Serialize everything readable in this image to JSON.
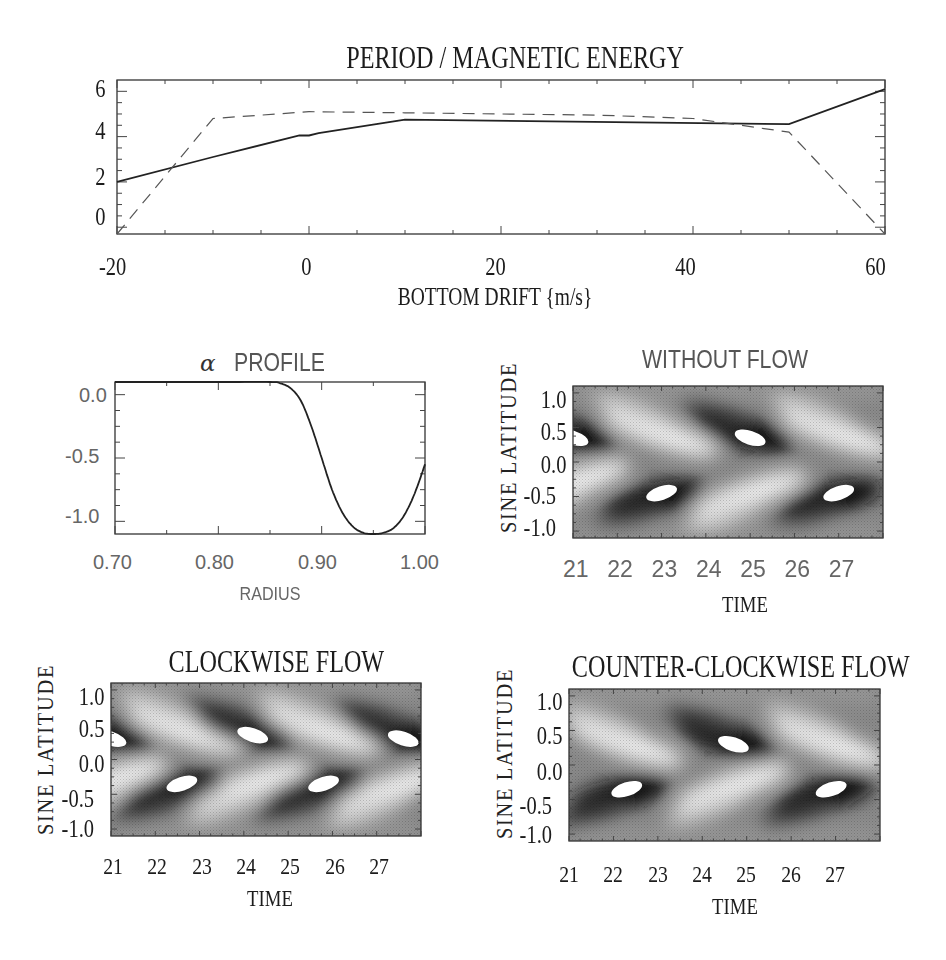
{
  "figure": {
    "top_plot": {
      "title": "PERIOD / MAGNETIC ENERGY",
      "xlabel": "BOTTOM DRIFT {m/s}",
      "xticks": [
        "-20",
        "0",
        "20",
        "40",
        "60"
      ],
      "yticks": [
        "6",
        "4",
        "2",
        "0"
      ]
    },
    "alpha_plot": {
      "title_symbol": "α",
      "title": "PROFILE",
      "xlabel": "RADIUS",
      "xticks": [
        "0.70",
        "0.80",
        "0.90",
        "1.00"
      ],
      "yticks": [
        "0.0",
        "-0.5",
        "-1.0"
      ]
    },
    "without_flow": {
      "title": "WITHOUT FLOW",
      "xlabel": "TIME",
      "ylabel": "SINE LATITUDE",
      "xticks": [
        "21",
        "22",
        "23",
        "24",
        "25",
        "26",
        "27"
      ],
      "yticks": [
        "1.0",
        "0.5",
        "0.0",
        "-0.5",
        "-1.0"
      ]
    },
    "clockwise": {
      "title": "CLOCKWISE FLOW",
      "xlabel": "TIME",
      "ylabel": "SINE LATITUDE",
      "xticks": [
        "21",
        "22",
        "23",
        "24",
        "25",
        "26",
        "27"
      ],
      "yticks": [
        "1.0",
        "0.5",
        "0.0",
        "-0.5",
        "-1.0"
      ]
    },
    "counter_clockwise": {
      "title": "COUNTER-CLOCKWISE FLOW",
      "xlabel": "TIME",
      "ylabel": "SINE LATITUDE",
      "xticks": [
        "21",
        "22",
        "23",
        "24",
        "25",
        "26",
        "27"
      ],
      "yticks": [
        "1.0",
        "0.5",
        "0.0",
        "-0.5",
        "-1.0"
      ]
    }
  },
  "chart_data": [
    {
      "type": "line",
      "title": "PERIOD / MAGNETIC ENERGY",
      "xlabel": "BOTTOM DRIFT {m/s}",
      "ylabel": "",
      "xlim": [
        -20,
        60
      ],
      "ylim": [
        -0.3,
        6.5
      ],
      "grid": false,
      "series": [
        {
          "name": "period (solid)",
          "style": "solid",
          "x": [
            -20,
            -10,
            -1,
            0,
            1,
            10,
            50,
            60
          ],
          "y": [
            2.0,
            3.1,
            4.05,
            4.05,
            4.15,
            4.75,
            4.55,
            6.1
          ]
        },
        {
          "name": "magnetic energy (dashed)",
          "style": "dashed",
          "x": [
            -20,
            -10,
            0,
            10,
            20,
            30,
            40,
            50,
            60
          ],
          "y": [
            -0.3,
            4.8,
            5.1,
            5.05,
            5.0,
            4.95,
            4.8,
            4.2,
            -0.3
          ]
        }
      ]
    },
    {
      "type": "line",
      "title": "α PROFILE",
      "xlabel": "RADIUS",
      "ylabel": "",
      "xlim": [
        0.7,
        1.0
      ],
      "ylim": [
        -1.1,
        0.1
      ],
      "grid": false,
      "series": [
        {
          "name": "alpha",
          "x": [
            0.7,
            0.8,
            0.85,
            0.86,
            0.87,
            0.88,
            0.89,
            0.9,
            0.91,
            0.92,
            0.93,
            0.94,
            0.95,
            0.96,
            0.97,
            0.98,
            0.99,
            1.0
          ],
          "y": [
            0.1,
            0.1,
            0.1,
            0.09,
            0.05,
            -0.05,
            -0.25,
            -0.5,
            -0.75,
            -0.93,
            -1.04,
            -1.09,
            -1.1,
            -1.09,
            -1.05,
            -0.95,
            -0.78,
            -0.55
          ]
        }
      ]
    },
    {
      "type": "heatmap",
      "title": "WITHOUT FLOW",
      "xlabel": "TIME",
      "ylabel": "SINE LATITUDE",
      "xlim": [
        21,
        28
      ],
      "ylim": [
        -1.1,
        1.1
      ],
      "features": {
        "north_dark_cores": [
          {
            "x": 21.0,
            "y": 0.35
          },
          {
            "x": 25.0,
            "y": 0.35
          }
        ],
        "south_dark_cores": [
          {
            "x": 23.0,
            "y": -0.45
          },
          {
            "x": 27.0,
            "y": -0.45
          }
        ],
        "north_bright_bands": [
          {
            "x": 23.0,
            "y": 0.4
          },
          {
            "x": 27.0,
            "y": 0.4
          }
        ],
        "south_bright_bands": [
          {
            "x": 21.0,
            "y": -0.3
          },
          {
            "x": 25.0,
            "y": -0.45
          }
        ]
      }
    },
    {
      "type": "heatmap",
      "title": "CLOCKWISE FLOW",
      "xlabel": "TIME",
      "ylabel": "SINE LATITUDE",
      "xlim": [
        21,
        28
      ],
      "ylim": [
        -1.1,
        1.1
      ],
      "features": {
        "north_dark_cores": [
          {
            "x": 21.0,
            "y": 0.3
          },
          {
            "x": 24.2,
            "y": 0.35
          },
          {
            "x": 27.6,
            "y": 0.3
          }
        ],
        "south_dark_cores": [
          {
            "x": 22.6,
            "y": -0.35
          },
          {
            "x": 25.8,
            "y": -0.35
          }
        ],
        "north_bright_bands": [
          {
            "x": 22.7,
            "y": 0.4
          },
          {
            "x": 25.8,
            "y": 0.4
          }
        ],
        "south_bright_bands": [
          {
            "x": 21.0,
            "y": -0.3
          },
          {
            "x": 24.2,
            "y": -0.35
          },
          {
            "x": 27.4,
            "y": -0.4
          }
        ]
      }
    },
    {
      "type": "heatmap",
      "title": "COUNTER-CLOCKWISE FLOW",
      "xlabel": "TIME",
      "ylabel": "SINE LATITUDE",
      "xlim": [
        21,
        28
      ],
      "ylim": [
        -1.1,
        1.1
      ],
      "features": {
        "north_dark_cores": [
          {
            "x": 24.7,
            "y": 0.3
          }
        ],
        "south_dark_cores": [
          {
            "x": 22.3,
            "y": -0.35
          },
          {
            "x": 26.9,
            "y": -0.35
          }
        ],
        "north_bright_bands": [
          {
            "x": 22.3,
            "y": 0.3
          },
          {
            "x": 26.9,
            "y": 0.3
          }
        ],
        "south_bright_bands": [
          {
            "x": 24.7,
            "y": -0.3
          }
        ]
      }
    }
  ]
}
